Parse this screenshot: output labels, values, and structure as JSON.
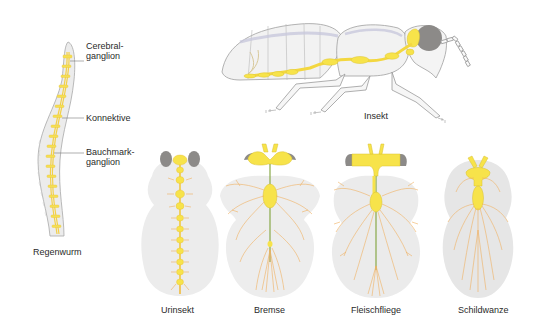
{
  "diagram": {
    "topic": "Nervensystem: Strickleiternervensystem",
    "colors": {
      "ganglion_yellow": "#f7e34a",
      "nerve_orange": "#f0b060",
      "body_gray": "#e6e6e6",
      "eye_gray": "#8c8a88",
      "outline": "#9a9a9a",
      "text": "#2a2a2a"
    },
    "organisms": [
      {
        "id": "regenwurm",
        "label": "Regenwurm"
      },
      {
        "id": "insekt",
        "label": "Insekt"
      },
      {
        "id": "urinsekt",
        "label": "Urinsekt"
      },
      {
        "id": "bremse",
        "label": "Bremse"
      },
      {
        "id": "fleischfliege",
        "label": "Fleischfliege"
      },
      {
        "id": "schildwanze",
        "label": "Schildwanze"
      }
    ],
    "callouts": [
      {
        "line1": "Cerebral-",
        "line2": "ganglion"
      },
      {
        "line1": "Konnektive",
        "line2": ""
      },
      {
        "line1": "Bauchmark-",
        "line2": "ganglion"
      }
    ]
  }
}
